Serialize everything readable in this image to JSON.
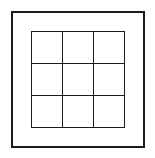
{
  "diagram": {
    "outer_frame": {
      "color": "#1a1a1a"
    },
    "grid": {
      "rows": 3,
      "cols": 3,
      "line_color": "#1a1a1a",
      "cells": [
        "",
        "",
        "",
        "",
        "",
        "",
        "",
        "",
        ""
      ]
    }
  }
}
